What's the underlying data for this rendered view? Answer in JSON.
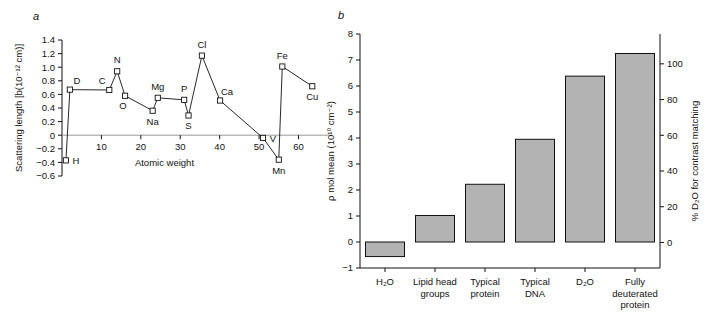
{
  "figure": {
    "panel_a_letter": "a",
    "panel_b_letter": "b"
  },
  "chart_data": [
    {
      "type": "line",
      "panel": "a",
      "title": "",
      "xlabel": "Atomic weight",
      "ylabel": "Scattering length [b(10⁻¹² cm)]",
      "xlim": [
        0,
        68
      ],
      "ylim": [
        -0.6,
        1.4
      ],
      "xticks": [
        10,
        20,
        30,
        40,
        50,
        60
      ],
      "xticklabels": [
        "10",
        "20",
        "30",
        "40",
        "50",
        "60"
      ],
      "yticks": [
        -0.6,
        -0.4,
        -0.2,
        0,
        0.2,
        0.4,
        0.6,
        0.8,
        1.0,
        1.2,
        1.4
      ],
      "yticklabels": [
        "−0.6",
        "−0.4",
        "−0.2",
        "0",
        "0.2",
        "0.4",
        "0.6",
        "0.8",
        "1.0",
        "1.2",
        "1.4"
      ],
      "grid": false,
      "legend": "none",
      "marker": "open-square",
      "points": [
        {
          "label": "H",
          "x": 1.0,
          "y": -0.37,
          "label_pos": "right"
        },
        {
          "label": "D",
          "x": 2.0,
          "y": 0.67,
          "label_pos": "above-right"
        },
        {
          "label": "C",
          "x": 12.0,
          "y": 0.665,
          "label_pos": "above-left"
        },
        {
          "label": "N",
          "x": 14.0,
          "y": 0.94,
          "label_pos": "above"
        },
        {
          "label": "O",
          "x": 16.0,
          "y": 0.58,
          "label_pos": "below-left"
        },
        {
          "label": "Na",
          "x": 23.0,
          "y": 0.36,
          "label_pos": "below"
        },
        {
          "label": "Mg",
          "x": 24.3,
          "y": 0.55,
          "label_pos": "above"
        },
        {
          "label": "P",
          "x": 31.0,
          "y": 0.52,
          "label_pos": "above"
        },
        {
          "label": "S",
          "x": 32.1,
          "y": 0.29,
          "label_pos": "below"
        },
        {
          "label": "Cl",
          "x": 35.5,
          "y": 1.17,
          "label_pos": "above"
        },
        {
          "label": "Ca",
          "x": 40.1,
          "y": 0.51,
          "label_pos": "above-right"
        },
        {
          "label": "V",
          "x": 51.0,
          "y": -0.04,
          "label_pos": "right"
        },
        {
          "label": "Mn",
          "x": 55.0,
          "y": -0.36,
          "label_pos": "below"
        },
        {
          "label": "Fe",
          "x": 55.9,
          "y": 1.01,
          "label_pos": "above"
        },
        {
          "label": "Cu",
          "x": 63.5,
          "y": 0.72,
          "label_pos": "below"
        }
      ]
    },
    {
      "type": "bar",
      "panel": "b",
      "title": "",
      "xlabel": "",
      "ylabel": "ρ mol mean (10¹⁰ cm⁻²)",
      "ylabel_right": "% D₂O for contrast matching",
      "categories": [
        "H₂O",
        "Lipid head groups",
        "Typical protein",
        "Typical DNA",
        "D₂O",
        "Fully deuterated protein"
      ],
      "category_lines": [
        [
          "H₂O"
        ],
        [
          "Lipid head",
          "groups"
        ],
        [
          "Typical",
          "protein"
        ],
        [
          "Typical",
          "DNA"
        ],
        [
          "D₂O"
        ],
        [
          "Fully",
          "deuterated",
          "protein"
        ]
      ],
      "values": [
        -0.56,
        1.02,
        2.22,
        3.95,
        6.38,
        7.25
      ],
      "values_right_percent": [
        0,
        22,
        40,
        64,
        100,
        112
      ],
      "ylim": [
        -1,
        8
      ],
      "yticks": [
        -1,
        0,
        1,
        2,
        3,
        4,
        5,
        6,
        7,
        8
      ],
      "yticklabels": [
        "−1",
        "0",
        "1",
        "2",
        "3",
        "4",
        "5",
        "6",
        "7",
        "8"
      ],
      "ylim_right": [
        -14.3,
        116.7
      ],
      "yticks_right": [
        0,
        20,
        40,
        60,
        80,
        100
      ],
      "yticklabels_right": [
        "0",
        "20",
        "40",
        "60",
        "80",
        "100"
      ],
      "grid": false,
      "legend": "none",
      "bar_color": "#b3b3b3",
      "bar_edge_color": "#111111"
    }
  ]
}
